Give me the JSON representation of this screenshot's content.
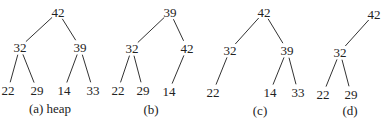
{
  "figures": [
    {
      "id": "a",
      "caption": "(a) heap",
      "caption_pos": [
        50,
        108
      ],
      "nodes": [
        {
          "label": "42",
          "x": 58,
          "y": 12
        },
        {
          "label": "32",
          "x": 20,
          "y": 47
        },
        {
          "label": "39",
          "x": 80,
          "y": 47
        },
        {
          "label": "22",
          "x": 8,
          "y": 90
        },
        {
          "label": "29",
          "x": 37,
          "y": 90
        },
        {
          "label": "14",
          "x": 64,
          "y": 90
        },
        {
          "label": "33",
          "x": 93,
          "y": 90
        }
      ],
      "edges": [
        [
          0,
          1
        ],
        [
          0,
          2
        ],
        [
          1,
          3
        ],
        [
          1,
          4
        ],
        [
          2,
          5
        ],
        [
          2,
          6
        ]
      ]
    },
    {
      "id": "b",
      "caption": "(b)",
      "caption_pos": [
        151,
        109
      ],
      "nodes": [
        {
          "label": "39",
          "x": 170,
          "y": 12
        },
        {
          "label": "32",
          "x": 132,
          "y": 48
        },
        {
          "label": "42",
          "x": 187,
          "y": 48
        },
        {
          "label": "22",
          "x": 118,
          "y": 90
        },
        {
          "label": "29",
          "x": 143,
          "y": 90
        },
        {
          "label": "14",
          "x": 169,
          "y": 91
        }
      ],
      "edges": [
        [
          0,
          1
        ],
        [
          0,
          2
        ],
        [
          1,
          3
        ],
        [
          1,
          4
        ],
        [
          2,
          5
        ]
      ]
    },
    {
      "id": "c",
      "caption": "(c)",
      "caption_pos": [
        260,
        110
      ],
      "nodes": [
        {
          "label": "42",
          "x": 264,
          "y": 12
        },
        {
          "label": "32",
          "x": 230,
          "y": 50
        },
        {
          "label": "39",
          "x": 287,
          "y": 50
        },
        {
          "label": "22",
          "x": 213,
          "y": 92
        },
        {
          "label": "14",
          "x": 270,
          "y": 92
        },
        {
          "label": "33",
          "x": 298,
          "y": 92
        }
      ],
      "edges": [
        [
          0,
          1
        ],
        [
          0,
          2
        ],
        [
          1,
          3
        ],
        [
          2,
          4
        ],
        [
          2,
          5
        ]
      ]
    },
    {
      "id": "d",
      "caption": "(d)",
      "caption_pos": [
        350,
        110
      ],
      "nodes": [
        {
          "label": "42",
          "x": 374,
          "y": 14
        },
        {
          "label": "32",
          "x": 340,
          "y": 52
        },
        {
          "label": "22",
          "x": 323,
          "y": 94
        },
        {
          "label": "29",
          "x": 351,
          "y": 94
        }
      ],
      "edges": [
        [
          0,
          1
        ],
        [
          1,
          2
        ],
        [
          1,
          3
        ]
      ]
    }
  ]
}
